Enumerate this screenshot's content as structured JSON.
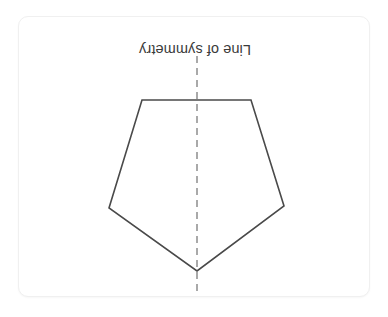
{
  "figure": {
    "label": "Line of symmetry",
    "label_rotation_degrees": 180,
    "shape_name": "pentagon",
    "orientation": "inverted",
    "stroke_color": "#4a4a4a",
    "fill_color": "#ffffff",
    "symmetry_line_color": "#9a9a9a",
    "symmetry_line_style": "dashed",
    "card_background": "#ffffff",
    "card_border_color": "#f0f0f0",
    "page_background": "#ffffff",
    "polygon_points": "123,83 232,83 265,189 178,254 90,191",
    "symmetry_line": {
      "x": 178,
      "y_top": 39,
      "y_bottom": 281
    }
  }
}
